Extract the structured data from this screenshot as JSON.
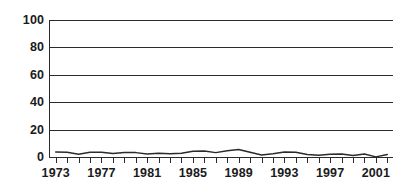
{
  "chart_data": {
    "type": "line",
    "title": "",
    "subtitle": "",
    "xlabel": "",
    "ylabel": "",
    "xlim": [
      1972.5,
      2002.5
    ],
    "ylim": [
      0,
      100
    ],
    "grid": true,
    "grid_axis": "y",
    "legend": false,
    "legend_position": "none",
    "line_color": "#2b2b2b",
    "gridline_color": "#2b2b2b",
    "axis_color": "#2b2b2b",
    "background_color": "#ffffff",
    "text_color": "#1a1a1a",
    "yticks": [
      0,
      20,
      40,
      60,
      80,
      100
    ],
    "ytick_labels": [
      "0",
      "20",
      "40",
      "60",
      "80",
      "100"
    ],
    "xticks": [
      1973,
      1974,
      1975,
      1976,
      1977,
      1978,
      1979,
      1980,
      1981,
      1982,
      1983,
      1984,
      1985,
      1986,
      1987,
      1988,
      1989,
      1990,
      1991,
      1992,
      1993,
      1994,
      1995,
      1996,
      1997,
      1998,
      1999,
      2000,
      2001,
      2002
    ],
    "xtick_labels_shown": [
      "1973",
      "1977",
      "1981",
      "1985",
      "1989",
      "1993",
      "1997",
      "2001"
    ],
    "xtick_labels_shown_values": [
      1973,
      1977,
      1981,
      1985,
      1989,
      1993,
      1997,
      2001
    ],
    "x": [
      1973,
      1974,
      1975,
      1976,
      1977,
      1978,
      1979,
      1980,
      1981,
      1982,
      1983,
      1984,
      1985,
      1986,
      1987,
      1988,
      1989,
      1990,
      1991,
      1992,
      1993,
      1994,
      1995,
      1996,
      1997,
      1998,
      1999,
      2000,
      2001,
      2002
    ],
    "series": [
      {
        "name": "series-1",
        "color": "#2b2b2b",
        "values": [
          3.6,
          3.4,
          2.0,
          3.4,
          3.4,
          2.6,
          3.3,
          3.2,
          2.2,
          2.7,
          2.4,
          2.8,
          4.2,
          4.3,
          3.2,
          4.6,
          5.4,
          3.4,
          1.5,
          2.4,
          3.6,
          3.4,
          1.8,
          1.2,
          2.0,
          2.2,
          1.1,
          2.2,
          0.1,
          1.9
        ]
      }
    ]
  }
}
